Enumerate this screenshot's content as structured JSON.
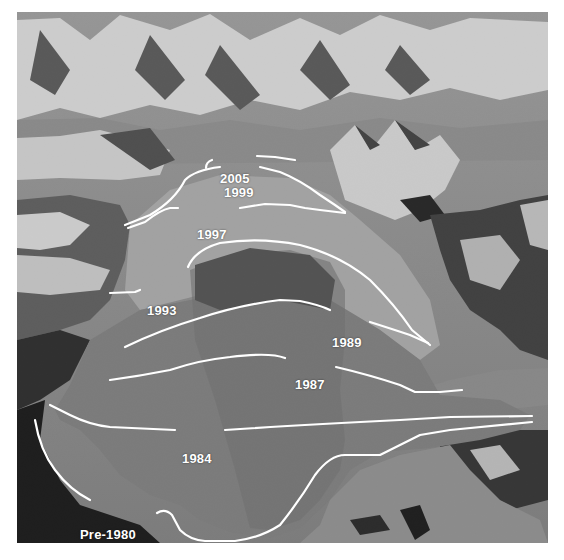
{
  "figure": {
    "line_color": "#ffffff",
    "labels": [
      {
        "year": "2005",
        "x": 219,
        "y": 172
      },
      {
        "year": "1999",
        "x": 224,
        "y": 186
      },
      {
        "year": "1997",
        "x": 197,
        "y": 228
      },
      {
        "year": "1993",
        "x": 147,
        "y": 304
      },
      {
        "year": "1989",
        "x": 332,
        "y": 336
      },
      {
        "year": "1987",
        "x": 295,
        "y": 378
      },
      {
        "year": "1984",
        "x": 182,
        "y": 452
      },
      {
        "year": "Pre-1980",
        "x": 80,
        "y": 528
      }
    ]
  }
}
